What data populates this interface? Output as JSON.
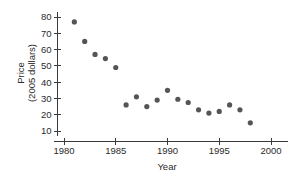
{
  "chart_data": {
    "type": "scatter",
    "title": "",
    "xlabel": "Year",
    "ylabel": "Price (2005 dollars)",
    "ylabel_lines": [
      "Price",
      "(2005 dollars)"
    ],
    "xlim": [
      1980,
      2000
    ],
    "ylim": [
      5,
      84
    ],
    "xticks": [
      1980,
      1985,
      1990,
      1995,
      2000
    ],
    "xtick_labels": [
      "1980",
      "1985",
      "1990",
      "1995",
      "2000"
    ],
    "yticks": [
      10,
      20,
      30,
      40,
      50,
      60,
      70,
      80
    ],
    "ytick_labels": [
      "10",
      "20",
      "30",
      "40",
      "50",
      "60",
      "70",
      "80"
    ],
    "grid": false,
    "legend": null,
    "marker": "circle",
    "marker_color": "#555555",
    "axis_color": "#3a3a3a",
    "x": [
      1981,
      1982,
      1983,
      1984,
      1985,
      1986,
      1987,
      1988,
      1989,
      1990,
      1991,
      1992,
      1993,
      1994,
      1995,
      1996,
      1997,
      1998
    ],
    "values": [
      77,
      65,
      57,
      54.5,
      49,
      26,
      31,
      25,
      29,
      35,
      29.5,
      27.5,
      23,
      21,
      22,
      26,
      23,
      15
    ],
    "points": [
      {
        "x": 1981,
        "y": 77
      },
      {
        "x": 1982,
        "y": 65
      },
      {
        "x": 1983,
        "y": 57
      },
      {
        "x": 1984,
        "y": 54.5
      },
      {
        "x": 1985,
        "y": 49
      },
      {
        "x": 1986,
        "y": 26
      },
      {
        "x": 1987,
        "y": 31
      },
      {
        "x": 1988,
        "y": 25
      },
      {
        "x": 1989,
        "y": 29
      },
      {
        "x": 1990,
        "y": 35
      },
      {
        "x": 1991,
        "y": 29.5
      },
      {
        "x": 1992,
        "y": 27.5
      },
      {
        "x": 1993,
        "y": 23
      },
      {
        "x": 1994,
        "y": 21
      },
      {
        "x": 1995,
        "y": 22
      },
      {
        "x": 1996,
        "y": 26
      },
      {
        "x": 1997,
        "y": 23
      },
      {
        "x": 1998,
        "y": 15
      }
    ]
  },
  "layout": {
    "plot_left_px": 64,
    "plot_right_px": 271,
    "y_top_value": 80,
    "y_top_px": 17,
    "y_bottom_value": 10,
    "y_bottom_px": 131,
    "x_axis_y_px": 141,
    "y_axis_x_px": 57.5,
    "y_axis_top_px": 12,
    "y_axis_bottom_px": 136,
    "dot_radius_px": 2.6
  }
}
